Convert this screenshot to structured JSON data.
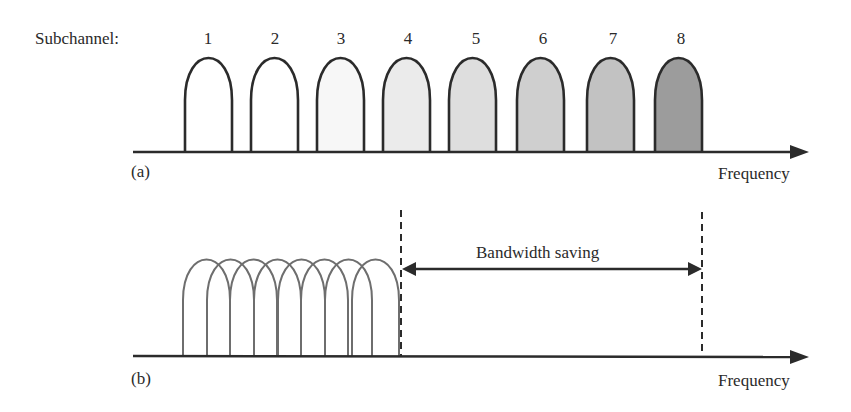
{
  "panel_a": {
    "title_label": "Subchannel:",
    "panel_label": "(a)",
    "axis_label": "Frequency",
    "subchannels": [
      {
        "label": "1",
        "fill": "#ffffff"
      },
      {
        "label": "2",
        "fill": "#ffffff"
      },
      {
        "label": "3",
        "fill": "#f7f7f7"
      },
      {
        "label": "4",
        "fill": "#ebebeb"
      },
      {
        "label": "5",
        "fill": "#dedede"
      },
      {
        "label": "6",
        "fill": "#cfcfcf"
      },
      {
        "label": "7",
        "fill": "#c2c2c2"
      },
      {
        "label": "8",
        "fill": "#9c9c9c"
      }
    ]
  },
  "panel_b": {
    "panel_label": "(b)",
    "axis_label": "Frequency",
    "annotation": "Bandwidth saving",
    "overlapping_subchannel_count": 8
  },
  "colors": {
    "stroke": "#2b2b2b",
    "overlap_stroke": "#6e6e6e",
    "background": "#ffffff"
  }
}
